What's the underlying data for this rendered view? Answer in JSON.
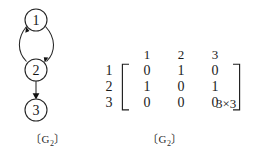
{
  "figure": {
    "background_color": "#ffffff",
    "ink_color": "#1a1a1a"
  },
  "graph": {
    "caption_open": "〔",
    "caption_name": "G",
    "caption_sub": "2",
    "caption_close": "〕",
    "nodes": [
      {
        "id": "1",
        "label": "1",
        "cx": 36,
        "cy": 20,
        "r": 11
      },
      {
        "id": "2",
        "label": "2",
        "cx": 36,
        "cy": 70,
        "r": 11
      },
      {
        "id": "3",
        "label": "3",
        "cx": 36,
        "cy": 110,
        "r": 11
      }
    ],
    "edges": [
      {
        "from": "1",
        "to": "2",
        "style": "curved-right"
      },
      {
        "from": "2",
        "to": "1",
        "style": "curved-left"
      },
      {
        "from": "2",
        "to": "3",
        "style": "straight"
      }
    ]
  },
  "matrix": {
    "column_headers": [
      "1",
      "2",
      "3"
    ],
    "row_labels": [
      "1",
      "2",
      "3"
    ],
    "rows": [
      [
        "0",
        "1",
        "0"
      ],
      [
        "1",
        "0",
        "1"
      ],
      [
        "0",
        "0",
        "0"
      ]
    ],
    "dimension_label": "3×3",
    "caption_open": "〔",
    "caption_name": "G",
    "caption_sub": "2",
    "caption_close": "〕"
  }
}
